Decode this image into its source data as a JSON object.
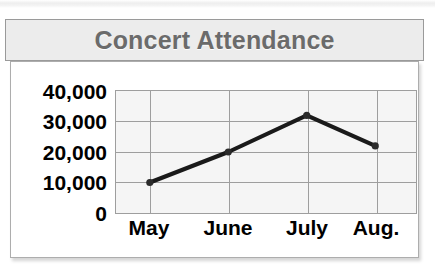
{
  "chart_data": {
    "type": "line",
    "title": "Concert Attendance",
    "xlabel": "",
    "ylabel": "",
    "categories": [
      "May",
      "June",
      "July",
      "Aug."
    ],
    "values": [
      10000,
      20000,
      32000,
      22000
    ],
    "ytick_labels": [
      "40,000",
      "30,000",
      "20,000",
      "10,000",
      "0"
    ],
    "yticks": [
      40000,
      30000,
      20000,
      10000,
      0
    ],
    "ylim": [
      0,
      40000
    ],
    "grid": true,
    "legend": false,
    "legend_position": "none",
    "series": [
      {
        "name": "Concert Attendance",
        "values": [
          10000,
          20000,
          32000,
          22000
        ]
      }
    ],
    "colors": {
      "line": "#1a1a1a",
      "marker": "#2b2b2b",
      "plot_background": "#f5f5f5",
      "gridline": "#9e9e9e",
      "title_text": "#6b6b6b",
      "title_banner": "#ececec",
      "axis_text": "#000000",
      "frame": "#adadad"
    }
  }
}
